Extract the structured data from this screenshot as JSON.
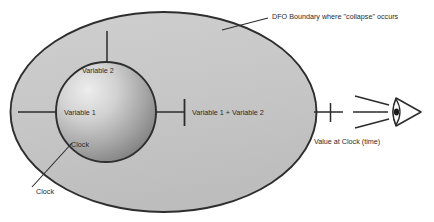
{
  "diagram": {
    "colors": {
      "outline": "#2e2e2e",
      "ellipse_fill": "#c8c8c8",
      "circle_light": "#eaeaea",
      "circle_dark": "#7f7f7f",
      "text": "#2b2b2b",
      "background": "#ffffff"
    },
    "boundary": {
      "shape": "ellipse",
      "callout_label": "DFO Boundary where \"collapse\" occurs"
    },
    "inner_circle": {
      "shape": "circle",
      "labels": {
        "top": "Variable 2",
        "middle": "Variable 1",
        "bottom": "Clock"
      }
    },
    "connectors": {
      "sum_label": "Variable 1 + Variable 2",
      "output_label": "Value at Clock (time)",
      "clock_callout_label": "Clock"
    },
    "observer": {
      "icon": "eye-icon",
      "sight_lines": 3
    }
  }
}
